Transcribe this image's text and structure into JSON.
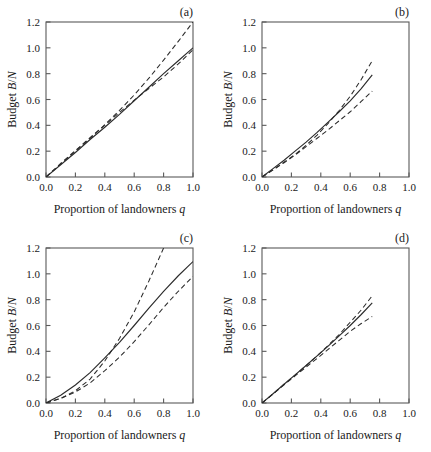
{
  "figure": {
    "panels": [
      {
        "id": "a",
        "label": "(a)",
        "xlabel_prefix": "Proportion of landowners ",
        "xlabel_var": "q",
        "ylabel_prefix": "Budget ",
        "ylabel_var1": "B",
        "ylabel_sep": "/",
        "ylabel_var2": "N"
      },
      {
        "id": "b",
        "label": "(b)",
        "xlabel_prefix": "Proportion of landowners ",
        "xlabel_var": "q",
        "ylabel_prefix": "Budget ",
        "ylabel_var1": "B",
        "ylabel_sep": "/",
        "ylabel_var2": "N"
      },
      {
        "id": "c",
        "label": "(c)",
        "xlabel_prefix": "Proportion of landowners ",
        "xlabel_var": "q",
        "ylabel_prefix": "Budget ",
        "ylabel_var1": "B",
        "ylabel_sep": "/",
        "ylabel_var2": "N"
      },
      {
        "id": "d",
        "label": "(d)",
        "xlabel_prefix": "Proportion of landowners ",
        "xlabel_var": "q",
        "ylabel_prefix": "Budget ",
        "ylabel_var1": "B",
        "ylabel_sep": "/",
        "ylabel_var2": "N"
      }
    ]
  },
  "chart_data": [
    {
      "type": "line",
      "panel": "a",
      "title": "(a)",
      "xlabel": "Proportion of landowners q",
      "ylabel": "Budget B/N",
      "xlim": [
        0.0,
        1.0
      ],
      "ylim": [
        0.0,
        1.2
      ],
      "xticks": [
        0.0,
        0.2,
        0.4,
        0.6,
        0.8,
        1.0
      ],
      "yticks": [
        0.0,
        0.2,
        0.4,
        0.6,
        0.8,
        1.0,
        1.2
      ],
      "xticklabels": [
        "0.0",
        "0.2",
        "0.4",
        "0.6",
        "0.8",
        "1.0"
      ],
      "yticklabels": [
        "0.0",
        "0.2",
        "0.4",
        "0.6",
        "0.8",
        "1.0",
        "1.2"
      ],
      "grid": false,
      "legend": "none",
      "x": [
        0.0,
        0.1,
        0.2,
        0.3,
        0.4,
        0.5,
        0.6,
        0.7,
        0.8,
        0.9,
        1.0
      ],
      "series": [
        {
          "name": "upper-dashed",
          "style": "dashed",
          "values": [
            0.0,
            0.1,
            0.2,
            0.3,
            0.405,
            0.515,
            0.635,
            0.765,
            0.905,
            1.05,
            1.2
          ]
        },
        {
          "name": "solid-middle",
          "style": "solid",
          "values": [
            0.0,
            0.095,
            0.19,
            0.29,
            0.385,
            0.485,
            0.59,
            0.695,
            0.8,
            0.9,
            1.0
          ]
        },
        {
          "name": "lower-dashed",
          "style": "dashed",
          "values": [
            0.0,
            0.105,
            0.205,
            0.305,
            0.4,
            0.5,
            0.595,
            0.685,
            0.775,
            0.875,
            0.985
          ]
        }
      ]
    },
    {
      "type": "line",
      "panel": "b",
      "title": "(b)",
      "xlabel": "Proportion of landowners q",
      "ylabel": "Budget B/N",
      "xlim": [
        0.0,
        1.0
      ],
      "ylim": [
        0.0,
        1.2
      ],
      "xticks": [
        0.0,
        0.2,
        0.4,
        0.6,
        0.8,
        1.0
      ],
      "yticks": [
        0.0,
        0.2,
        0.4,
        0.6,
        0.8,
        1.0,
        1.2
      ],
      "xticklabels": [
        "0.0",
        "0.2",
        "0.4",
        "0.6",
        "0.8",
        "1.0"
      ],
      "yticklabels": [
        "0.0",
        "0.2",
        "0.4",
        "0.6",
        "0.8",
        "1.0",
        "1.2"
      ],
      "grid": false,
      "legend": "none",
      "x": [
        0.0,
        0.075,
        0.15,
        0.225,
        0.3,
        0.375,
        0.45,
        0.525,
        0.6,
        0.675,
        0.75
      ],
      "series": [
        {
          "name": "upper-dashed",
          "style": "dashed",
          "values": [
            0.0,
            0.055,
            0.115,
            0.175,
            0.245,
            0.325,
            0.415,
            0.515,
            0.625,
            0.755,
            0.9
          ]
        },
        {
          "name": "solid-middle",
          "style": "solid",
          "values": [
            0.0,
            0.065,
            0.13,
            0.2,
            0.27,
            0.345,
            0.425,
            0.505,
            0.59,
            0.685,
            0.79
          ]
        },
        {
          "name": "lower-dashed",
          "style": "dashed",
          "values": [
            0.0,
            0.055,
            0.11,
            0.17,
            0.235,
            0.3,
            0.365,
            0.435,
            0.505,
            0.585,
            0.665
          ]
        }
      ]
    },
    {
      "type": "line",
      "panel": "c",
      "title": "(c)",
      "xlabel": "Proportion of landowners q",
      "ylabel": "Budget B/N",
      "xlim": [
        0.0,
        1.0
      ],
      "ylim": [
        0.0,
        1.2
      ],
      "xticks": [
        0.0,
        0.2,
        0.4,
        0.6,
        0.8,
        1.0
      ],
      "yticks": [
        0.0,
        0.2,
        0.4,
        0.6,
        0.8,
        1.0,
        1.2
      ],
      "xticklabels": [
        "0.0",
        "0.2",
        "0.4",
        "0.6",
        "0.8",
        "1.0"
      ],
      "yticklabels": [
        "0.0",
        "0.2",
        "0.4",
        "0.6",
        "0.8",
        "1.0",
        "1.2"
      ],
      "grid": false,
      "legend": "none",
      "x": [
        0.0,
        0.1,
        0.2,
        0.3,
        0.4,
        0.5,
        0.6,
        0.7,
        0.8,
        0.9,
        1.0
      ],
      "series": [
        {
          "name": "upper-dashed-steep",
          "style": "dashed",
          "values": [
            0.0,
            0.035,
            0.095,
            0.185,
            0.325,
            0.5,
            0.705,
            0.945,
            1.2,
            null,
            null
          ],
          "note": "exits top of axes near q = 0.79"
        },
        {
          "name": "solid-middle",
          "style": "solid",
          "values": [
            0.0,
            0.06,
            0.14,
            0.235,
            0.35,
            0.47,
            0.6,
            0.735,
            0.865,
            0.985,
            1.095
          ]
        },
        {
          "name": "lower-dashed",
          "style": "dashed",
          "values": [
            0.0,
            0.035,
            0.085,
            0.155,
            0.25,
            0.355,
            0.475,
            0.605,
            0.74,
            0.865,
            0.98
          ]
        }
      ]
    },
    {
      "type": "line",
      "panel": "d",
      "title": "(d)",
      "xlabel": "Proportion of landowners q",
      "ylabel": "Budget B/N",
      "xlim": [
        0.0,
        1.0
      ],
      "ylim": [
        0.0,
        1.2
      ],
      "xticks": [
        0.0,
        0.2,
        0.4,
        0.6,
        0.8,
        1.0
      ],
      "yticks": [
        0.0,
        0.2,
        0.4,
        0.6,
        0.8,
        1.0,
        1.2
      ],
      "xticklabels": [
        "0.0",
        "0.2",
        "0.4",
        "0.6",
        "0.8",
        "1.0"
      ],
      "yticklabels": [
        "0.0",
        "0.2",
        "0.4",
        "0.6",
        "0.8",
        "1.0",
        "1.2"
      ],
      "grid": false,
      "legend": "none",
      "x": [
        0.0,
        0.075,
        0.15,
        0.225,
        0.3,
        0.375,
        0.45,
        0.525,
        0.6,
        0.675,
        0.75
      ],
      "series": [
        {
          "name": "upper-dashed",
          "style": "dashed",
          "values": [
            0.0,
            0.07,
            0.145,
            0.215,
            0.29,
            0.365,
            0.445,
            0.53,
            0.625,
            0.72,
            0.83
          ]
        },
        {
          "name": "solid-middle",
          "style": "solid",
          "values": [
            0.0,
            0.072,
            0.145,
            0.218,
            0.29,
            0.365,
            0.44,
            0.52,
            0.6,
            0.685,
            0.775
          ]
        },
        {
          "name": "lower-dashed",
          "style": "dashed",
          "values": [
            0.0,
            0.07,
            0.14,
            0.21,
            0.278,
            0.345,
            0.415,
            0.485,
            0.555,
            0.615,
            0.67
          ]
        }
      ]
    }
  ]
}
